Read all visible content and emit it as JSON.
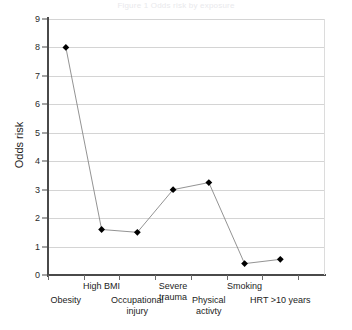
{
  "figure": {
    "top_caption": "Figure 1   Odds risk by exposure",
    "background_color": "#ffffff",
    "marker_color": "#000000",
    "line_color": "#878787",
    "grid_color": "#d4d4d4",
    "axis_color": "#4a4a4a"
  },
  "chart_data": {
    "type": "line",
    "title": "",
    "xlabel": "",
    "ylabel": "Odds risk",
    "categories": [
      "Obesity",
      "High BMI",
      "Occupational injury",
      "Severe trauma",
      "Physical activty",
      "Smoking",
      "HRT >10 years"
    ],
    "category_label_lines": [
      [
        "Obesity"
      ],
      [
        "High BMI"
      ],
      [
        "Occupational",
        "injury"
      ],
      [
        "Severe",
        "trauma"
      ],
      [
        "Physical",
        "activty"
      ],
      [
        "Smoking"
      ],
      [
        "HRT >10 years"
      ]
    ],
    "values": [
      8,
      1.6,
      1.5,
      3,
      3.25,
      0.4,
      0.55
    ],
    "ylim": [
      0,
      9
    ],
    "yticks": [
      0,
      1,
      2,
      3,
      4,
      5,
      6,
      7,
      8,
      9
    ],
    "ytick_labels": [
      "0",
      "1",
      "2",
      "3",
      "4",
      "5",
      "6",
      "7",
      "8",
      "9"
    ],
    "grid": true,
    "grid_axis": "y",
    "legend": false,
    "legend_position": "none",
    "marker": "diamond",
    "series": [
      {
        "name": "Odds risk",
        "values": [
          8,
          1.6,
          1.5,
          3,
          3.25,
          0.4,
          0.55
        ]
      }
    ]
  }
}
